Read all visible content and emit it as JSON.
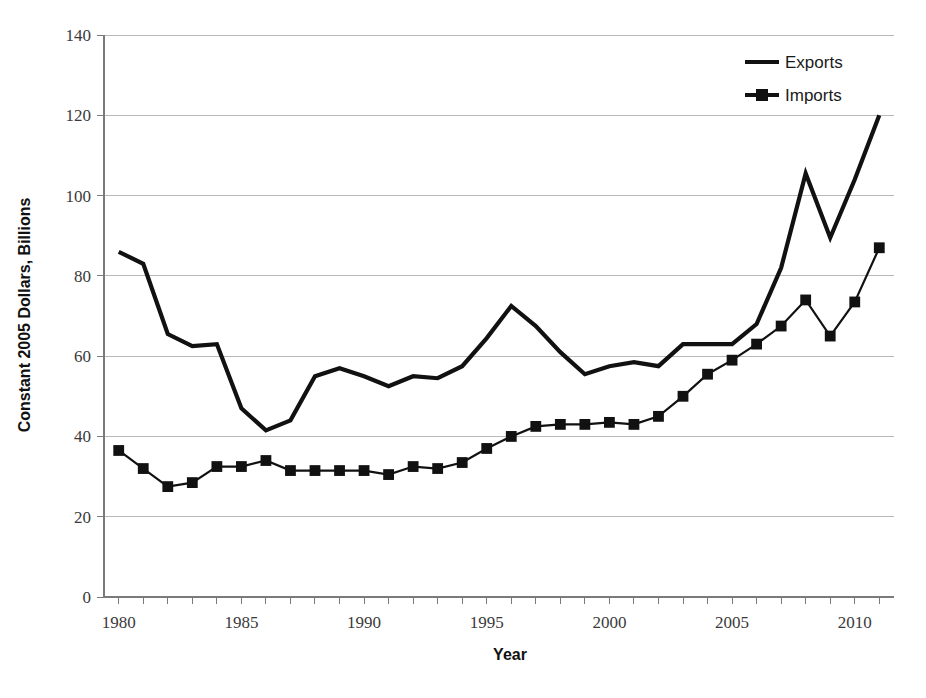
{
  "chart_data": {
    "type": "line",
    "title": "",
    "xlabel": "Year",
    "ylabel": "Constant 2005 Dollars, Billions",
    "xlim": [
      1979.4,
      2011.6
    ],
    "ylim": [
      0,
      140
    ],
    "grid": true,
    "legend_position": "top-right",
    "y_ticks": [
      0,
      20,
      40,
      60,
      80,
      100,
      120,
      140
    ],
    "x_ticks": [
      1980,
      1985,
      1990,
      1995,
      2000,
      2005,
      2010
    ],
    "x_minor_tick_interval": 1,
    "x": [
      1980,
      1981,
      1982,
      1983,
      1984,
      1985,
      1986,
      1987,
      1988,
      1989,
      1990,
      1991,
      1992,
      1993,
      1994,
      1995,
      1996,
      1997,
      1998,
      1999,
      2000,
      2001,
      2002,
      2003,
      2004,
      2005,
      2006,
      2007,
      2008,
      2009,
      2010,
      2011
    ],
    "series": [
      {
        "name": "Exports",
        "marker": "none",
        "color": "#111111",
        "values": [
          86.0,
          83.0,
          65.5,
          62.5,
          63.0,
          47.0,
          41.5,
          44.0,
          55.0,
          57.0,
          55.0,
          52.5,
          55.0,
          54.5,
          57.5,
          64.5,
          72.5,
          67.5,
          61.0,
          55.5,
          57.5,
          58.5,
          57.5,
          63.0,
          63.0,
          63.0,
          68.0,
          82.0,
          105.5,
          89.5,
          104.0,
          120.0
        ]
      },
      {
        "name": "Imports",
        "marker": "square",
        "color": "#111111",
        "values": [
          36.5,
          32.0,
          27.5,
          28.5,
          32.5,
          32.5,
          34.0,
          31.5,
          31.5,
          31.5,
          31.5,
          30.5,
          32.5,
          32.0,
          33.5,
          37.0,
          40.0,
          42.5,
          43.0,
          43.0,
          43.5,
          43.0,
          45.0,
          50.0,
          55.5,
          59.0,
          63.0,
          67.5,
          74.0,
          65.0,
          73.5,
          87.0
        ]
      }
    ]
  },
  "legend": {
    "items": [
      {
        "label": "Exports",
        "style": "line"
      },
      {
        "label": "Imports",
        "style": "line-square"
      }
    ]
  },
  "axes": {
    "x_title": "Year",
    "y_title": "Constant 2005 Dollars, Billions"
  },
  "caption": {
    "text": ""
  }
}
